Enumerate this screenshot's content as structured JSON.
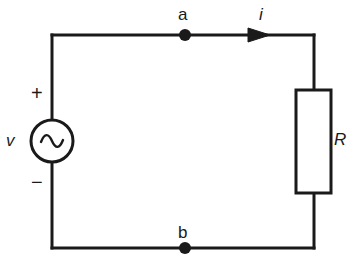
{
  "diagram": {
    "type": "circuit-schematic",
    "stroke_color": "#1a1a1a",
    "background_color": "#ffffff",
    "line_width": 3,
    "labels": {
      "node_a": "a",
      "node_b": "b",
      "current": "i",
      "voltage_source": "v",
      "resistor": "R",
      "polarity_positive": "+",
      "polarity_negative": "−"
    },
    "components": {
      "source": {
        "name": "ac-voltage-source",
        "symbol": "sine-wave",
        "center_x": 52,
        "center_y": 141,
        "radius": 21
      },
      "resistor": {
        "name": "resistor",
        "symbol": "rectangle-box",
        "x": 296,
        "y": 90,
        "width": 35,
        "height": 103
      },
      "current_arrow": {
        "name": "current-direction-arrow",
        "direction": "right",
        "x": 248,
        "y": 35
      },
      "node_dots": [
        {
          "label": "a",
          "x": 185,
          "y": 35,
          "radius": 6
        },
        {
          "label": "b",
          "x": 185,
          "y": 248,
          "radius": 6
        }
      ]
    },
    "wires": {
      "top_left_corner_x": 52,
      "top_y": 35,
      "bottom_y": 248,
      "right_x": 314
    }
  }
}
